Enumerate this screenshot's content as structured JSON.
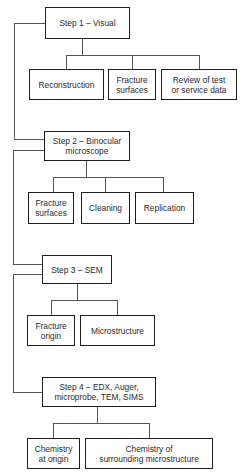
{
  "diagram": {
    "type": "flowchart",
    "steps": [
      {
        "label": "Step 1 – Visual",
        "children": [
          "Reconstruction",
          "Fracture\nsurfaces",
          "Review of test\nor service data"
        ]
      },
      {
        "label": "Step 2 – Binocular\nmicroscope",
        "children": [
          "Fracture\nsurfaces",
          "Cleaning",
          "Replication"
        ]
      },
      {
        "label": "Step 3 – SEM",
        "children": [
          "Fracture\norigin",
          "Microstructure"
        ]
      },
      {
        "label": "Step 4 – EDX, Auger,\nmicroprobe, TEM, SIMS",
        "children": [
          "Chemistry\nat origin",
          "Chemistry of\nsurrounding microstructure"
        ]
      }
    ],
    "colors": {
      "line": "#1e1e1e",
      "background": "#ffffff",
      "text": "#2a2a2a"
    }
  }
}
